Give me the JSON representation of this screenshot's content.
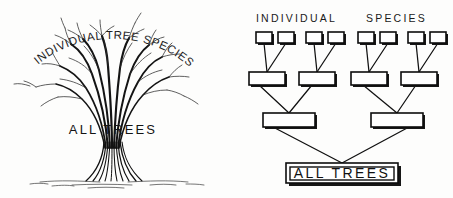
{
  "figure": {
    "background_color": "#fdfdfc",
    "ink_color": "#111111"
  },
  "left_panel": {
    "name": "tree-illustration",
    "top_label": "INDIVIDUAL TREE SPECIES",
    "top_label_letters": [
      "I",
      "N",
      "D",
      "I",
      "V",
      "I",
      "D",
      "U",
      "A",
      "L",
      " ",
      "T",
      "R",
      "E",
      "E",
      " ",
      "S",
      "P",
      "E",
      "C",
      "I",
      "E",
      "S"
    ],
    "base_label": "ALL TREES"
  },
  "right_panel": {
    "name": "hierarchy-diagram",
    "header_left": "INDIVIDUAL",
    "header_right": "SPECIES",
    "root_label": "ALL TREES",
    "levels": [
      {
        "level": 1,
        "name": "species-row",
        "count": 8,
        "box_width": 16,
        "box_height": 11,
        "y": 32,
        "x_positions": [
          30,
          52,
          80,
          102,
          132,
          154,
          182,
          204
        ]
      },
      {
        "level": 2,
        "name": "genus-row",
        "count": 4,
        "box_width": 36,
        "box_height": 13,
        "y": 72,
        "x_positions": [
          23,
          73,
          125,
          175
        ]
      },
      {
        "level": 3,
        "name": "family-row",
        "count": 2,
        "box_width": 52,
        "box_height": 14,
        "y": 113,
        "x_positions": [
          37,
          145
        ]
      },
      {
        "level": 4,
        "name": "root-row",
        "count": 1,
        "box_width": 112,
        "box_height": 20,
        "y": 163,
        "x_positions": [
          60
        ]
      }
    ],
    "edges": [
      {
        "from_level": 1,
        "to_level": 2,
        "pairs": [
          [
            0,
            0
          ],
          [
            1,
            0
          ],
          [
            2,
            1
          ],
          [
            3,
            1
          ],
          [
            4,
            2
          ],
          [
            5,
            2
          ],
          [
            6,
            3
          ],
          [
            7,
            3
          ]
        ]
      },
      {
        "from_level": 2,
        "to_level": 3,
        "pairs": [
          [
            0,
            0
          ],
          [
            1,
            0
          ],
          [
            2,
            1
          ],
          [
            3,
            1
          ]
        ]
      },
      {
        "from_level": 3,
        "to_level": 4,
        "pairs": [
          [
            0,
            0
          ],
          [
            1,
            0
          ]
        ]
      }
    ]
  }
}
